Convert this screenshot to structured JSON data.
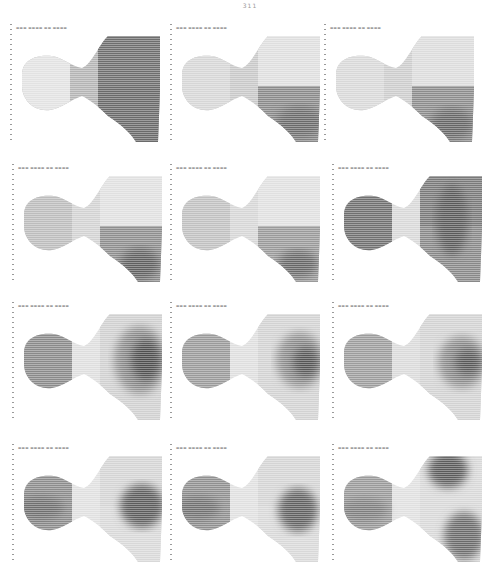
{
  "page": {
    "number": "311"
  },
  "figure": {
    "layout": {
      "rows": 4,
      "cols": 3
    },
    "panels": [
      {
        "id": 1,
        "header": "",
        "left": "#e2e2e2",
        "neck": "#b4b4b4",
        "rightTop": "#6e6e6e",
        "rightBot": "#6a6a6a",
        "blobs": []
      },
      {
        "id": 2,
        "header": "",
        "left": "#d6d6d6",
        "neck": "#c8c8c8",
        "rightTop": "#dedede",
        "rightBot": "#8a8a8a",
        "blobs": [
          {
            "cx": 132,
            "cy": 102,
            "rx": 24,
            "ry": 16,
            "c": "#6a6a6a"
          }
        ]
      },
      {
        "id": 3,
        "header": "",
        "left": "#d8d8d8",
        "neck": "#cccccc",
        "rightTop": "#dcdcdc",
        "rightBot": "#8c8c8c",
        "blobs": [
          {
            "cx": 130,
            "cy": 104,
            "rx": 22,
            "ry": 16,
            "c": "#666666"
          }
        ]
      },
      {
        "id": 4,
        "header": "",
        "left": "#bcbcbc",
        "neck": "#d2d2d2",
        "rightTop": "#e0e0e0",
        "rightBot": "#8e8e8e",
        "blobs": [
          {
            "cx": 130,
            "cy": 104,
            "rx": 20,
            "ry": 16,
            "c": "#5e5e5e"
          }
        ]
      },
      {
        "id": 5,
        "header": "",
        "left": "#c0c0c0",
        "neck": "#d6d6d6",
        "rightTop": "#e0e0e0",
        "rightBot": "#9a9a9a",
        "blobs": [
          {
            "cx": 130,
            "cy": 104,
            "rx": 20,
            "ry": 14,
            "c": "#666666"
          }
        ]
      },
      {
        "id": 6,
        "header": "",
        "left": "#707070",
        "neck": "#d8d8d8",
        "rightTop": "#7a7a7a",
        "rightBot": "#888888",
        "blobs": [
          {
            "cx": 122,
            "cy": 60,
            "rx": 16,
            "ry": 36,
            "c": "#5a5a5a"
          }
        ]
      },
      {
        "id": 7,
        "header": "",
        "left": "#8a8a8a",
        "neck": "#dedede",
        "rightTop": "#d0d0d0",
        "rightBot": "#d0d0d0",
        "blobs": [
          {
            "cx": 130,
            "cy": 62,
            "rx": 26,
            "ry": 34,
            "c": "#8a8a8a"
          },
          {
            "cx": 136,
            "cy": 62,
            "rx": 16,
            "ry": 22,
            "c": "#505050"
          }
        ]
      },
      {
        "id": 8,
        "header": "",
        "left": "#9a9a9a",
        "neck": "#dedede",
        "rightTop": "#d2d2d2",
        "rightBot": "#d2d2d2",
        "blobs": [
          {
            "cx": 132,
            "cy": 62,
            "rx": 24,
            "ry": 28,
            "c": "#8c8c8c"
          },
          {
            "cx": 138,
            "cy": 64,
            "rx": 14,
            "ry": 16,
            "c": "#555555"
          }
        ]
      },
      {
        "id": 9,
        "header": "",
        "left": "#9c9c9c",
        "neck": "#dadada",
        "rightTop": "#d2d2d2",
        "rightBot": "#d2d2d2",
        "blobs": [
          {
            "cx": 132,
            "cy": 64,
            "rx": 24,
            "ry": 26,
            "c": "#8a8a8a"
          },
          {
            "cx": 138,
            "cy": 64,
            "rx": 14,
            "ry": 14,
            "c": "#585858"
          }
        ]
      },
      {
        "id": 10,
        "header": "",
        "left": "#8c8c8c",
        "neck": "#e0e0e0",
        "rightTop": "#d4d4d4",
        "rightBot": "#d8d8d8",
        "blobs": [
          {
            "cx": 30,
            "cy": 68,
            "rx": 24,
            "ry": 12,
            "c": "#6e6e6e"
          },
          {
            "cx": 132,
            "cy": 66,
            "rx": 22,
            "ry": 22,
            "c": "#5c5c5c"
          }
        ]
      },
      {
        "id": 11,
        "header": "",
        "left": "#909090",
        "neck": "#e0e0e0",
        "rightTop": "#d4d4d4",
        "rightBot": "#d8d8d8",
        "blobs": [
          {
            "cx": 30,
            "cy": 68,
            "rx": 22,
            "ry": 12,
            "c": "#707070"
          },
          {
            "cx": 130,
            "cy": 70,
            "rx": 20,
            "ry": 22,
            "c": "#606060"
          }
        ]
      },
      {
        "id": 12,
        "header": "",
        "left": "#9a9a9a",
        "neck": "#e0e0e0",
        "rightTop": "#d8d8d8",
        "rightBot": "#d8d8d8",
        "blobs": [
          {
            "cx": 118,
            "cy": 30,
            "rx": 20,
            "ry": 18,
            "c": "#5a5a5a"
          },
          {
            "cx": 134,
            "cy": 96,
            "rx": 20,
            "ry": 24,
            "c": "#6a6a6a"
          },
          {
            "cx": 34,
            "cy": 70,
            "rx": 24,
            "ry": 12,
            "c": "#7e7e7e"
          }
        ]
      }
    ],
    "positions": [
      [
        8,
        20
      ],
      [
        168,
        20
      ],
      [
        322,
        20
      ],
      [
        10,
        160
      ],
      [
        168,
        160
      ],
      [
        330,
        160
      ],
      [
        10,
        298
      ],
      [
        168,
        298
      ],
      [
        330,
        298
      ],
      [
        10,
        440
      ],
      [
        168,
        440
      ],
      [
        330,
        440
      ]
    ]
  }
}
